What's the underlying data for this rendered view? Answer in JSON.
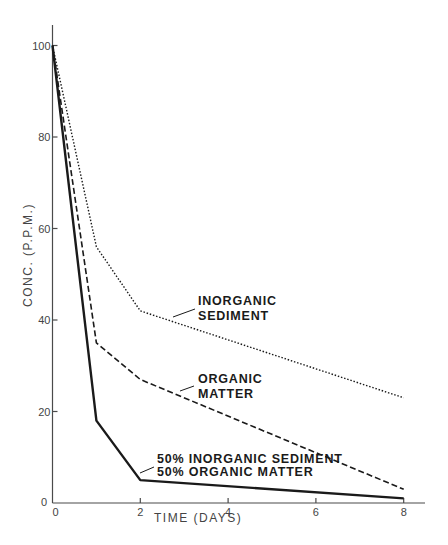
{
  "chart_data": {
    "type": "line",
    "title": "",
    "xlabel": "TIME (DAYS)",
    "ylabel": "CONC. (P.P.M.)",
    "xlim": [
      0,
      8
    ],
    "ylim": [
      0,
      100
    ],
    "x_ticks": [
      0,
      2,
      4,
      6,
      8
    ],
    "y_ticks": [
      0,
      20,
      40,
      60,
      80,
      100
    ],
    "x_tick_labels": [
      "0",
      "2",
      "4",
      "6",
      "8"
    ],
    "y_tick_labels": [
      "0",
      "20",
      "40",
      "60",
      "80",
      "100"
    ],
    "grid": false,
    "legend": "inline annotations",
    "series": [
      {
        "name": "INORGANIC SEDIMENT",
        "style": "dotted",
        "x": [
          0,
          1,
          2,
          8
        ],
        "y": [
          100,
          56,
          42,
          23
        ]
      },
      {
        "name": "ORGANIC MATTER",
        "style": "dashed",
        "x": [
          0,
          1,
          2,
          8
        ],
        "y": [
          100,
          35,
          27,
          3
        ]
      },
      {
        "name": "50% INORGANIC SEDIMENT 50% ORGANIC MATTER",
        "style": "solid",
        "x": [
          0,
          1,
          2,
          8
        ],
        "y": [
          100,
          18,
          5,
          1
        ]
      }
    ],
    "annotations": [
      {
        "lines": [
          "INORGANIC",
          "SEDIMENT"
        ],
        "series": 0
      },
      {
        "lines": [
          "ORGANIC",
          "MATTER"
        ],
        "series": 1
      },
      {
        "lines": [
          "50% INORGANIC SEDIMENT",
          "50% ORGANIC MATTER"
        ],
        "series": 2
      }
    ]
  },
  "axes": {
    "x_title": "TIME (DAYS)",
    "y_title": "CONC. (P.P.M.)",
    "origin_label": "0"
  },
  "labels": {
    "inorganic_1": "INORGANIC",
    "inorganic_2": "SEDIMENT",
    "organic_1": "ORGANIC",
    "organic_2": "MATTER",
    "mix_1": "50% INORGANIC SEDIMENT",
    "mix_2": "50% ORGANIC MATTER"
  },
  "colors": {
    "line": "#1a1a1a",
    "axis": "#4a4a4a",
    "background": "#ffffff"
  }
}
